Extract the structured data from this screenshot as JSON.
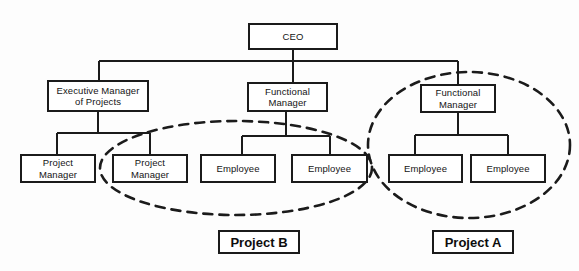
{
  "diagram": {
    "type": "org-chart",
    "background_color": "#fdfdfd",
    "line_color": "#1b1b1b",
    "text_color": "#141414"
  },
  "nodes": [
    {
      "id": "ceo",
      "label": "CEO",
      "x": 248,
      "y": 23,
      "w": 90,
      "h": 27
    },
    {
      "id": "exec-manager-projects",
      "label": "Executive Manager\nof Projects",
      "x": 47,
      "y": 80,
      "w": 102,
      "h": 32
    },
    {
      "id": "functional-manager-center",
      "label": "Functional\nManager",
      "x": 247,
      "y": 82,
      "w": 81,
      "h": 30
    },
    {
      "id": "functional-manager-right",
      "label": "Functional\nManager",
      "x": 420,
      "y": 84,
      "w": 76,
      "h": 29
    },
    {
      "id": "project-manager-1",
      "label": "Project\nManager",
      "x": 20,
      "y": 154,
      "w": 76,
      "h": 29
    },
    {
      "id": "project-manager-2",
      "label": "Project\nManager",
      "x": 112,
      "y": 154,
      "w": 76,
      "h": 29
    },
    {
      "id": "employee-1",
      "label": "Employee",
      "x": 200,
      "y": 154,
      "w": 76,
      "h": 29
    },
    {
      "id": "employee-2",
      "label": "Employee",
      "x": 291,
      "y": 154,
      "w": 77,
      "h": 29
    },
    {
      "id": "employee-3",
      "label": "Employee",
      "x": 388,
      "y": 154,
      "w": 75,
      "h": 29
    },
    {
      "id": "employee-4",
      "label": "Employee",
      "x": 470,
      "y": 154,
      "w": 76,
      "h": 29
    }
  ],
  "groupings": [
    {
      "id": "project-b-ellipse",
      "label": "Project B",
      "cx": 236,
      "cy": 168,
      "rx": 136,
      "ry": 47
    },
    {
      "id": "project-a-ellipse",
      "label": "Project A",
      "cx": 469,
      "cy": 145,
      "rx": 101,
      "ry": 73
    }
  ],
  "legends": [
    {
      "id": "project-b-label",
      "label": "Project B",
      "x": 218,
      "y": 230,
      "w": 82,
      "h": 24
    },
    {
      "id": "project-a-label",
      "label": "Project A",
      "x": 432,
      "y": 230,
      "w": 82,
      "h": 24
    }
  ],
  "connectors": {
    "description": "Solid orthogonal lines connecting CEO down to managers and managers down to their reports",
    "ceo_drop": {
      "x": 293,
      "y1": 50,
      "y2": 61
    },
    "top_bus": {
      "y": 61,
      "x1": 99,
      "x2": 458
    },
    "branch_drops": [
      {
        "x": 99,
        "y1": 61,
        "y2": 80
      },
      {
        "x": 293,
        "y1": 61,
        "y2": 82
      },
      {
        "x": 458,
        "y1": 61,
        "y2": 84
      }
    ],
    "exec_subtree": {
      "stem_x": 98,
      "stem_y1": 112,
      "stem_y2": 133,
      "bar_y": 133,
      "bar_x1": 57,
      "bar_x2": 150,
      "child_x": [
        57,
        150
      ],
      "child_y2": 154
    },
    "center_subtree": {
      "stem_x": 286,
      "stem_y1": 112,
      "stem_y2": 136,
      "bar_y": 136,
      "bar_x1": 242,
      "bar_x2": 330,
      "child_x": [
        242,
        330
      ],
      "child_y2": 154
    },
    "right_subtree": {
      "stem_x": 458,
      "stem_y1": 113,
      "stem_y2": 135,
      "bar_y": 135,
      "bar_x1": 415,
      "bar_x2": 508,
      "child_x": [
        415,
        508
      ],
      "child_y2": 154
    }
  }
}
